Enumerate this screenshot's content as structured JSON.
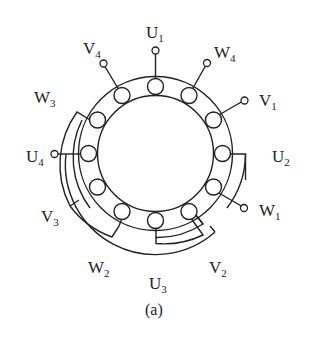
{
  "figure": {
    "caption": "(a)",
    "slot_count": 12,
    "colors": {
      "stroke": "#222222",
      "background": "#ffffff"
    }
  },
  "terminals": [
    {
      "id": "U1",
      "letter": "U",
      "index": "1"
    },
    {
      "id": "W4",
      "letter": "W",
      "index": "4"
    },
    {
      "id": "V1",
      "letter": "V",
      "index": "1"
    },
    {
      "id": "U2",
      "letter": "U",
      "index": "2"
    },
    {
      "id": "W1",
      "letter": "W",
      "index": "1"
    },
    {
      "id": "V2",
      "letter": "V",
      "index": "2"
    },
    {
      "id": "U3",
      "letter": "U",
      "index": "3"
    },
    {
      "id": "W2",
      "letter": "W",
      "index": "2"
    },
    {
      "id": "V3",
      "letter": "V",
      "index": "3"
    },
    {
      "id": "U4",
      "letter": "U",
      "index": "4"
    },
    {
      "id": "W3",
      "letter": "W",
      "index": "3"
    },
    {
      "id": "V4",
      "letter": "V",
      "index": "4"
    }
  ]
}
